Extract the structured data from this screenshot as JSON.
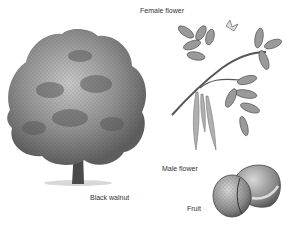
{
  "title": "Black walnut",
  "labels": {
    "tree": "Black walnut",
    "female_flower": "Female flower",
    "male_flower": "Male flower",
    "fruit": "Fruit"
  },
  "colors": {
    "ink": "#333333",
    "foliage_dark": "#5a5a5a",
    "foliage_mid": "#8c8c8c",
    "foliage_light": "#bdbdbd",
    "background": "#ffffff"
  }
}
